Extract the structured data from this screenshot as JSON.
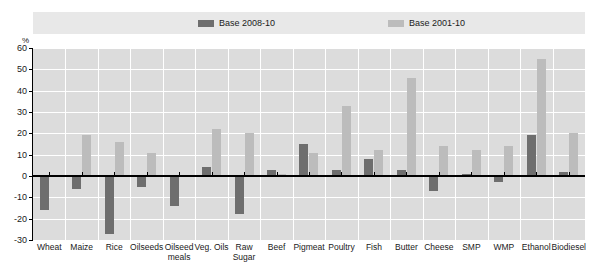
{
  "chart_data": {
    "type": "bar",
    "title": "",
    "subtitle": "",
    "xlabel": "",
    "ylabel": "%",
    "ylim": [
      -30,
      60
    ],
    "yticks": [
      -30,
      -20,
      -10,
      0,
      10,
      20,
      30,
      40,
      50,
      60
    ],
    "grid": true,
    "legend_position": "top",
    "categories": [
      "Wheat",
      "Maize",
      "Rice",
      "Oilseeds",
      "Oilseed\nmeals",
      "Veg. Oils",
      "Raw\nSugar",
      "Beef",
      "Pigmeat",
      "Poultry",
      "Fish",
      "Butter",
      "Cheese",
      "SMP",
      "WMP",
      "Ethanol",
      "Biodiesel"
    ],
    "series": [
      {
        "name": "Base 2008-10",
        "color": "#6e6e6e",
        "values": [
          -16,
          -6,
          -27,
          -5,
          -14,
          4,
          -18,
          3,
          15,
          3,
          8,
          3,
          -7,
          1,
          -3,
          19,
          2
        ]
      },
      {
        "name": "Base 2001-10",
        "color": "#bcbcbc",
        "values": [
          0,
          19,
          16,
          11,
          0,
          22,
          20,
          1,
          11,
          33,
          12,
          46,
          14,
          12,
          14,
          55,
          20
        ]
      }
    ]
  },
  "legend": {
    "items": [
      {
        "label": "Base 2008-10",
        "color": "#6e6e6e"
      },
      {
        "label": "Base 2001-10",
        "color": "#bcbcbc"
      }
    ]
  },
  "axis": {
    "unit": "%"
  }
}
